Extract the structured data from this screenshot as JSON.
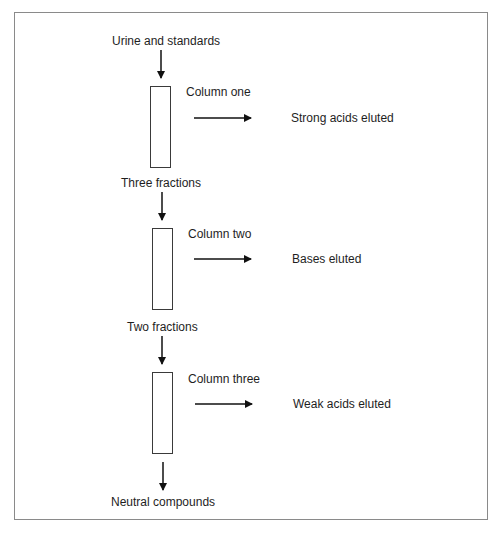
{
  "diagram": {
    "type": "flowchart",
    "title": "",
    "input": "Urine and standards",
    "stages": [
      {
        "column": "Column one",
        "output": "Strong acids eluted",
        "remaining": "Three fractions"
      },
      {
        "column": "Column two",
        "output": "Bases eluted",
        "remaining": "Two fractions"
      },
      {
        "column": "Column three",
        "output": "Weak acids eluted",
        "remaining": "Neutral compounds"
      }
    ]
  }
}
